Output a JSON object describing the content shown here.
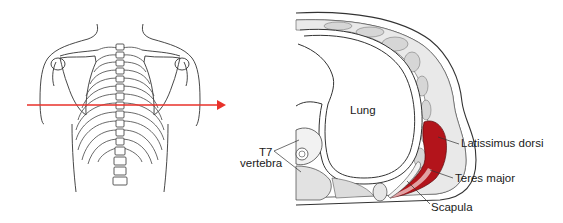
{
  "figure": {
    "left_panel": {
      "description": "posterior view of thorax with rib cage, spine and scapulae",
      "section_arrow": {
        "color": "#e8312a",
        "direction": "right"
      }
    },
    "right_panel": {
      "description": "horizontal cross-section at T7 level",
      "highlight_color": "#b3141b",
      "labels": {
        "lung": "Lung",
        "vertebra_line1": "T7",
        "vertebra_line2": "vertebra",
        "latissimus": "Latissimus dorsi",
        "teres": "Teres major",
        "scapula": "Scapula"
      }
    }
  }
}
